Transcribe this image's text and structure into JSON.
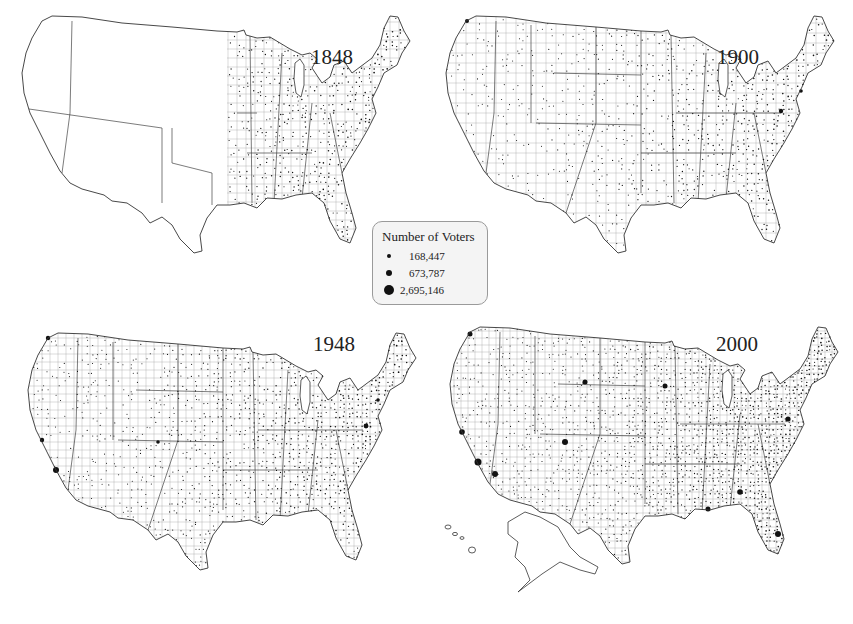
{
  "chart_data": {
    "type": "map",
    "subtype": "proportional-dot-map",
    "panels": [
      {
        "year": "1848",
        "label": "1848",
        "extent": "eastern states settled; western territories largely unpopulated",
        "relative_density": 0.35
      },
      {
        "year": "1900",
        "label": "1900",
        "extent": "contiguous US; Oklahoma, Arizona, New Mexico territories empty",
        "relative_density": 0.7
      },
      {
        "year": "1948",
        "label": "1948",
        "extent": "contiguous US",
        "relative_density": 0.85
      },
      {
        "year": "2000",
        "label": "2000",
        "extent": "contiguous US plus Alaska and Hawaii",
        "relative_density": 1.0
      }
    ],
    "legend": {
      "title": "Number of Voters",
      "entries": [
        {
          "label": "168,447",
          "value": 168447
        },
        {
          "label": "673,787",
          "value": 673787
        },
        {
          "label": "2,695,146",
          "value": 2695146
        }
      ]
    }
  },
  "colors": {
    "outline": "#333333",
    "county_lines": "#9a9a9a",
    "dots": "#111111",
    "legend_bg": "#f4f4f4",
    "legend_border": "#9a9a9a"
  }
}
